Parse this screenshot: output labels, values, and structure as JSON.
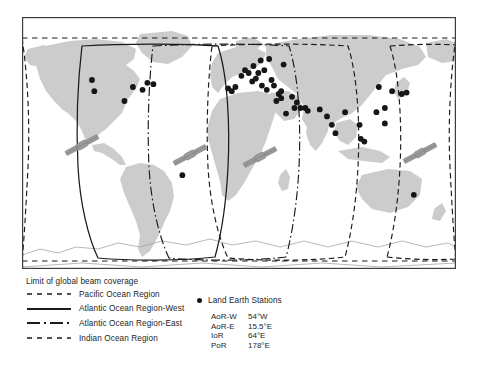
{
  "figure": {
    "map": {
      "ocean_color": "#ffffff",
      "land_color": "#cccccc",
      "coastline_color": "#8c8c8c",
      "border_color": "#3d3d3d",
      "station_color": "#161616",
      "beam_line_color": "#1a1a1a",
      "satellite_color": "#9b9b9b",
      "satellite_count": 4,
      "station_count": 52
    },
    "legend": {
      "title": "Limit of global beam coverage",
      "items": [
        {
          "label": "Pacific Ocean Region",
          "style": "dashed"
        },
        {
          "label": "Atlantic Ocean Region-West",
          "style": "solid"
        },
        {
          "label": "Atlantic Ocean Region-East",
          "style": "dash-dot"
        },
        {
          "label": "Indian Ocean Region",
          "style": "dashed"
        }
      ],
      "stations": {
        "header": "Land Earth Stations",
        "marker": "filled-circle-icon",
        "rows": [
          {
            "code": "AoR-W",
            "longitude": "54°W"
          },
          {
            "code": "AoR-E",
            "longitude": "15.5°E"
          },
          {
            "code": "IoR",
            "longitude": "64°E"
          },
          {
            "code": "PoR",
            "longitude": "178°E"
          }
        ]
      }
    }
  },
  "chart_data": {
    "type": "map",
    "title": "Limit of global beam coverage",
    "projection": "equirectangular",
    "xlim": [
      -180,
      180
    ],
    "ylim": [
      -90,
      90
    ],
    "grid": false,
    "legend_position": "below",
    "series": [
      {
        "name": "Pacific Ocean Region",
        "style": "dashed",
        "satellite_longitude": 178,
        "code": "PoR"
      },
      {
        "name": "Atlantic Ocean Region-West",
        "style": "solid",
        "satellite_longitude": -54,
        "code": "AoR-W"
      },
      {
        "name": "Atlantic Ocean Region-East",
        "style": "dash-dot",
        "satellite_longitude": 15.5,
        "code": "AoR-E"
      },
      {
        "name": "Indian Ocean Region",
        "style": "dashed",
        "satellite_longitude": 64,
        "code": "IoR"
      }
    ],
    "markers": {
      "name": "Land Earth Stations",
      "symbol": "filled-circle",
      "points": [
        [
          -122,
          45
        ],
        [
          -120,
          37
        ],
        [
          -95,
          30
        ],
        [
          -88,
          40
        ],
        [
          -80,
          38
        ],
        [
          -76,
          43
        ],
        [
          -71,
          42
        ],
        [
          -47,
          -23
        ],
        [
          -9,
          39
        ],
        [
          -6,
          37
        ],
        [
          -3,
          40
        ],
        [
          2,
          48
        ],
        [
          5,
          52
        ],
        [
          8,
          50
        ],
        [
          11,
          44
        ],
        [
          12,
          55
        ],
        [
          14,
          46
        ],
        [
          16,
          50
        ],
        [
          18,
          59
        ],
        [
          19,
          41
        ],
        [
          21,
          52
        ],
        [
          23,
          38
        ],
        [
          25,
          60
        ],
        [
          27,
          45
        ],
        [
          29,
          41
        ],
        [
          31,
          30
        ],
        [
          33,
          35
        ],
        [
          35,
          32
        ],
        [
          35,
          37
        ],
        [
          37,
          56
        ],
        [
          39,
          21
        ],
        [
          44,
          33
        ],
        [
          46,
          25
        ],
        [
          48,
          29
        ],
        [
          51,
          25
        ],
        [
          55,
          25
        ],
        [
          57,
          23
        ],
        [
          67,
          24
        ],
        [
          73,
          19
        ],
        [
          77,
          13
        ],
        [
          80,
          7
        ],
        [
          88,
          22
        ],
        [
          100,
          13
        ],
        [
          101,
          3
        ],
        [
          104,
          1
        ],
        [
          114,
          22
        ],
        [
          116,
          40
        ],
        [
          121,
          25
        ],
        [
          121,
          14
        ],
        [
          127,
          37
        ],
        [
          135,
          35
        ],
        [
          139,
          36
        ],
        [
          145,
          -37
        ]
      ]
    }
  }
}
